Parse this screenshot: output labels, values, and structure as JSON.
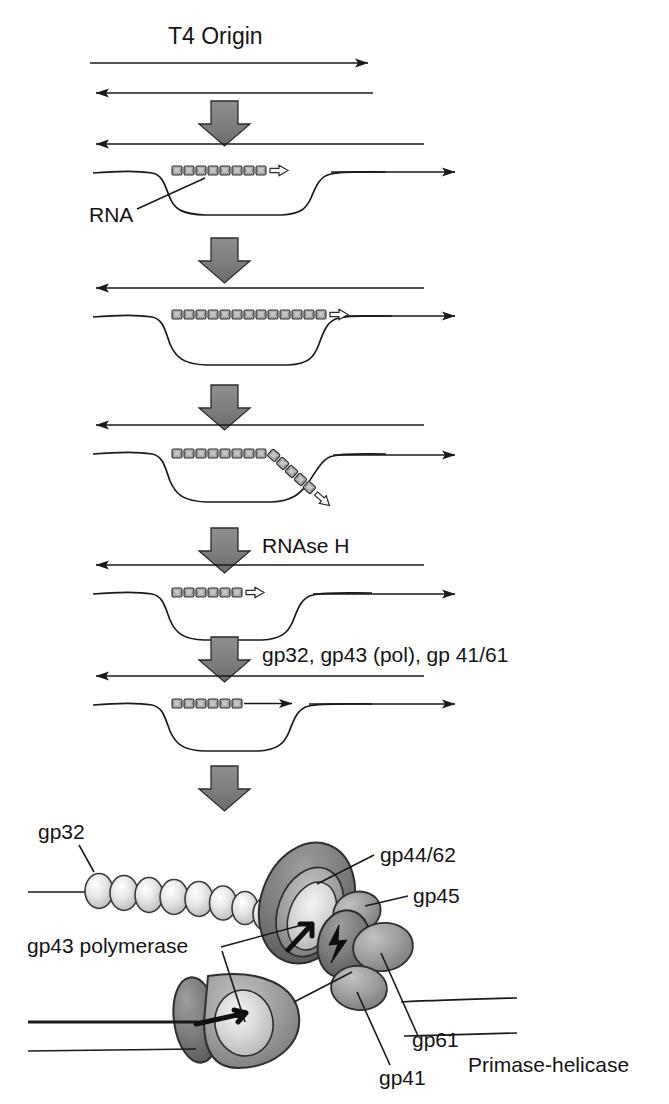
{
  "figure": {
    "title": "T4 Origin",
    "type": "biological-mechanism-diagram",
    "background_color": "#ffffff",
    "line_color": "#1a1a1a",
    "arrow_fill_color": "#808080",
    "rna_fill_color": "#a6a6a6",
    "protein_dark_color": "#6e6e6e",
    "protein_mid_color": "#9a9a9a",
    "protein_light_color": "#d8d8d8"
  },
  "labels": {
    "title": "T4 Origin",
    "rna": "RNA",
    "rnase_h": "RNAse H",
    "enzymes": "gp32, gp43 (pol), gp 41/61",
    "gp32": "gp32",
    "gp44_62": "gp44/62",
    "gp45": "gp45",
    "gp43_polymerase": "gp43 polymerase",
    "gp61": "gp61",
    "gp41": "gp41",
    "primase_helicase": "Primase-helicase"
  },
  "steps": [
    {
      "id": "step-1",
      "name": "duplex-dna-with-r-loop",
      "description": "Double-stranded T4 origin DNA; top strand arrow right, bottom strand arrow left",
      "rna_segments": 0
    },
    {
      "id": "step-2",
      "name": "r-loop-formation",
      "description": "RNA transcript anneals to template forming an R-loop with displaced strand",
      "rna_segments": 9,
      "rna_arrowhead": "hollow"
    },
    {
      "id": "step-3",
      "name": "r-loop-extension",
      "description": "RNA primer extended across the bubble",
      "rna_segments": 14,
      "rna_arrowhead": "hollow"
    },
    {
      "id": "step-4",
      "name": "rna-strand-displacement",
      "description": "RNA primer 3' end turns down and out of the duplex",
      "rna_segments": 9,
      "rna_arrowhead": "hollow",
      "branch": true
    },
    {
      "id": "step-5",
      "name": "rnase-h-trimmed-primer",
      "description": "RNAse H trims the RNA primer to a short stretch",
      "rna_segments": 6,
      "rna_arrowhead": "hollow"
    },
    {
      "id": "step-6",
      "name": "dna-synthesis-from-primer",
      "description": "gp43 extends DNA from the trimmed RNA primer",
      "rna_segments": 6,
      "rna_arrowhead": "solid-dna"
    }
  ],
  "transitions": [
    {
      "id": "arrow-1",
      "label": ""
    },
    {
      "id": "arrow-2",
      "label": ""
    },
    {
      "id": "arrow-3",
      "label": "RNAse H"
    },
    {
      "id": "arrow-4",
      "label": "gp32, gp43 (pol), gp 41/61"
    },
    {
      "id": "arrow-5",
      "label": ""
    }
  ],
  "replisome": {
    "name": "T4 replisome assembly",
    "components": [
      {
        "id": "gp32",
        "label": "gp32",
        "shape": "bead-chain",
        "count": 8,
        "role": "single-stranded DNA binding protein"
      },
      {
        "id": "gp44-62",
        "label": "gp44/62",
        "shape": "clamp-loader",
        "role": "clamp loader"
      },
      {
        "id": "gp45",
        "label": "gp45",
        "shape": "sliding-clamp",
        "role": "sliding clamp"
      },
      {
        "id": "gp43-polymerase",
        "label": "gp43 polymerase",
        "shape": "polymerase-blob",
        "role": "DNA polymerase"
      },
      {
        "id": "gp61",
        "label": "gp61",
        "shape": "lobe",
        "role": "primase"
      },
      {
        "id": "gp41",
        "label": "gp41",
        "shape": "lobe",
        "role": "helicase"
      },
      {
        "id": "primase-helicase",
        "label": "Primase-helicase",
        "shape": "annotation",
        "role": "complex name"
      }
    ]
  }
}
